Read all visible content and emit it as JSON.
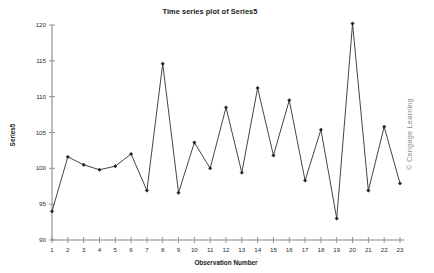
{
  "figure": {
    "width": 434,
    "height": 273,
    "background": "#ffffff",
    "watermark": "© Cengage Learning",
    "watermark_color": "#8a8a8a"
  },
  "chart_data": {
    "type": "line",
    "title": "Time series plot of Series5",
    "xlabel": "Observation Number",
    "ylabel": "Series5",
    "x": [
      1,
      2,
      3,
      4,
      5,
      6,
      7,
      8,
      9,
      10,
      11,
      12,
      13,
      14,
      15,
      16,
      17,
      18,
      19,
      20,
      21,
      22,
      23
    ],
    "values": [
      94.0,
      101.6,
      100.5,
      99.8,
      100.3,
      102.0,
      96.9,
      114.6,
      96.6,
      103.6,
      100.0,
      108.5,
      99.4,
      111.2,
      101.8,
      109.5,
      98.3,
      105.4,
      93.0,
      120.2,
      96.9,
      105.8,
      97.9
    ],
    "series_name": "Series5",
    "xlim": [
      1,
      23
    ],
    "ylim": [
      90,
      120
    ],
    "ytick_labels": [
      "90",
      "95",
      "100",
      "105",
      "110",
      "115",
      "120"
    ],
    "yticks": [
      90,
      95,
      100,
      105,
      110,
      115,
      120
    ],
    "xtick_labels": [
      "1",
      "2",
      "3",
      "4",
      "5",
      "6",
      "7",
      "8",
      "9",
      "10",
      "11",
      "12",
      "13",
      "14",
      "15",
      "16",
      "17",
      "18",
      "19",
      "20",
      "21",
      "22",
      "23"
    ],
    "grid": false,
    "legend": false,
    "marker": "diamond",
    "line_color": "#3a3a3a",
    "marker_color": "#1f1f1f",
    "axis_color": "#888888"
  }
}
